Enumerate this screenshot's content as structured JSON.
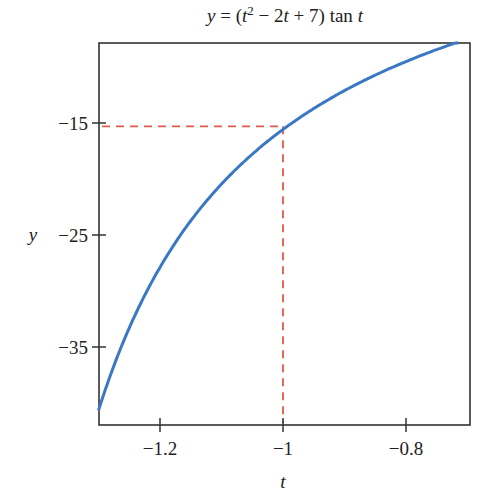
{
  "chart_data": {
    "type": "line",
    "title_parts": {
      "pre": "y = (t",
      "sup": "2",
      "post": " − 2t + 7) tan t"
    },
    "xlabel": "t",
    "ylabel": "y",
    "xlim": [
      -1.3,
      -0.7
    ],
    "ylim": [
      -42,
      -7.9
    ],
    "xticks": [
      -1.2,
      -1,
      -0.8
    ],
    "xtick_labels": [
      "−1.2",
      "−1",
      "−0.8"
    ],
    "yticks": [
      -15,
      -25,
      -35
    ],
    "ytick_labels": [
      "−15",
      "−25",
      "−35"
    ],
    "grid": false,
    "series": [
      {
        "name": "y = (t^2 - 2t + 7) tan t",
        "color": "#3b78c4",
        "x": [
          -1.3,
          -1.25,
          -1.2,
          -1.15,
          -1.1,
          -1.05,
          -1.0,
          -0.95,
          -0.9,
          -0.85,
          -0.8,
          -0.75,
          -0.72
        ],
        "y": [
          -40.5,
          -32.7,
          -27.2,
          -23.1,
          -19.8,
          -17.3,
          -15.3,
          -13.5,
          -12.1,
          -10.8,
          -9.7,
          -8.7,
          -8.1
        ]
      }
    ],
    "annotations": [
      {
        "type": "dashed-guide",
        "color": "#e05a4a",
        "point": {
          "t": -1,
          "y": -15.3
        },
        "description": "dashed lines from y-axis and t-axis to the point (−1, ≈−15.3)"
      }
    ]
  }
}
